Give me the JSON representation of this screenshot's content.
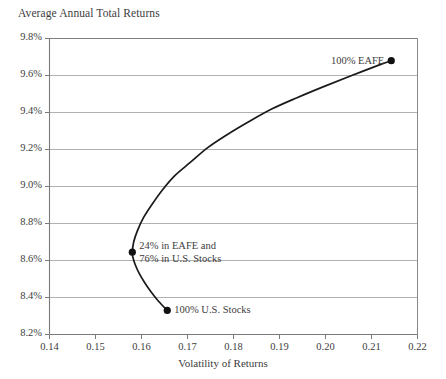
{
  "chart_data": {
    "type": "line",
    "title": "Average Annual Total Returns",
    "xlabel": "Volatility of Returns",
    "ylabel": "Average Annual Total Returns",
    "xlim": [
      0.14,
      0.22
    ],
    "ylim": [
      8.2,
      9.8
    ],
    "grid": true,
    "legend": "none",
    "xticks": [
      "0.14",
      "0.15",
      "0.16",
      "0.17",
      "0.18",
      "0.19",
      "0.20",
      "0.21",
      "0.22"
    ],
    "xtick_values": [
      0.14,
      0.15,
      0.16,
      0.17,
      0.18,
      0.19,
      0.2,
      0.21,
      0.22
    ],
    "yticks": [
      "8.2%",
      "8.4%",
      "8.6%",
      "8.8%",
      "9.0%",
      "9.2%",
      "9.4%",
      "9.6%",
      "9.8%"
    ],
    "ytick_values": [
      8.2,
      8.4,
      8.6,
      8.8,
      9.0,
      9.2,
      9.4,
      9.6,
      9.8
    ],
    "series": [
      {
        "name": "Efficient frontier (EAFE / U.S. Stocks mix)",
        "x": [
          0.1656,
          0.1637,
          0.1621,
          0.1607,
          0.1595,
          0.1586,
          0.1581,
          0.158,
          0.1583,
          0.1591,
          0.1604,
          0.1622,
          0.1645,
          0.1673,
          0.1706,
          0.1744,
          0.1786,
          0.1833,
          0.1884,
          0.1938,
          0.1996,
          0.2057,
          0.212,
          0.2143
        ],
        "y": [
          8.33,
          8.38,
          8.43,
          8.48,
          8.53,
          8.58,
          8.62,
          8.645,
          8.7,
          8.76,
          8.83,
          8.9,
          8.98,
          9.06,
          9.13,
          9.21,
          9.28,
          9.35,
          9.42,
          9.48,
          9.54,
          9.6,
          9.66,
          9.68
        ]
      }
    ],
    "points": [
      {
        "id": "eafe-100",
        "label": "100% EAFE",
        "label_lines": [
          "100% EAFE"
        ],
        "x": 0.2143,
        "y": 9.68,
        "label_position": "left"
      },
      {
        "id": "mix-24-76",
        "label": "24% in EAFE and 76% in U.S. Stocks",
        "label_lines": [
          "24% in EAFE and",
          "76% in U.S. Stocks"
        ],
        "x": 0.158,
        "y": 8.645,
        "label_position": "right"
      },
      {
        "id": "us-stocks-100",
        "label": "100% U.S. Stocks",
        "label_lines": [
          "100% U.S. Stocks"
        ],
        "x": 0.1656,
        "y": 8.33,
        "label_position": "right"
      }
    ]
  },
  "colors": {
    "curve": "#1a1a1a",
    "marker": "#111111",
    "grid": "#a8a8a8",
    "axis": "#7a7a7a",
    "text": "#3d3d3d",
    "background": "#ffffff"
  }
}
